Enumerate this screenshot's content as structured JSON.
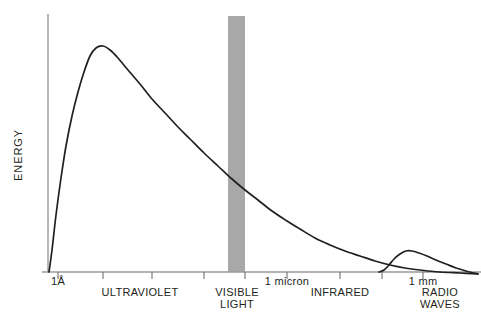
{
  "chart_data": {
    "type": "line",
    "title": "",
    "subtitle": "",
    "xlabel": "",
    "ylabel": "ENERGY",
    "grid": false,
    "legend": "none",
    "axis_style": "schematic, unnumbered logarithmic wavelength axis",
    "xlim": [
      0,
      1
    ],
    "ylim": [
      0,
      1
    ],
    "x_tick_labels": [
      {
        "id": "angstrom",
        "text": "1Å",
        "x_px": 58
      },
      {
        "id": "one-micron",
        "text": "1 micron",
        "x_px": 287
      },
      {
        "id": "one-mm",
        "text": "1 mm",
        "x_px": 423
      }
    ],
    "region_labels": [
      {
        "id": "ultraviolet",
        "text": "ULTRAVIOLET",
        "x_px": 140,
        "row": 2
      },
      {
        "id": "visible",
        "text": "VISIBLE",
        "x_px": 237,
        "row": 2
      },
      {
        "id": "light",
        "text": "LIGHT",
        "x_px": 237,
        "row": 3
      },
      {
        "id": "infrared",
        "text": "INFRARED",
        "x_px": 340,
        "row": 2
      },
      {
        "id": "radio",
        "text": "RADIO",
        "x_px": 440,
        "row": 2
      },
      {
        "id": "waves",
        "text": "WAVES",
        "x_px": 440,
        "row": 3
      }
    ],
    "ticks_px": [
      58,
      103,
      152,
      204,
      245,
      287,
      340,
      382,
      423
    ],
    "visible_band": {
      "label": "VISIBLE LIGHT",
      "color": "#a8a8a8",
      "x_start_px": 228,
      "x_end_px": 245
    },
    "series": [
      {
        "name": "blackbody-spectrum",
        "description": "main energy curve peaking in the ultraviolet and falling through visible, infrared toward radio",
        "points_px": [
          [
            49,
            272
          ],
          [
            52,
            250
          ],
          [
            56,
            215
          ],
          [
            61,
            178
          ],
          [
            66,
            146
          ],
          [
            72,
            116
          ],
          [
            78,
            92
          ],
          [
            84,
            72
          ],
          [
            90,
            56
          ],
          [
            96,
            48
          ],
          [
            103,
            46
          ],
          [
            110,
            50
          ],
          [
            118,
            58
          ],
          [
            128,
            70
          ],
          [
            140,
            84
          ],
          [
            152,
            99
          ],
          [
            165,
            113
          ],
          [
            178,
            127
          ],
          [
            190,
            139
          ],
          [
            204,
            153
          ],
          [
            218,
            166
          ],
          [
            232,
            179
          ],
          [
            245,
            190
          ],
          [
            258,
            200
          ],
          [
            272,
            211
          ],
          [
            287,
            221
          ],
          [
            300,
            229
          ],
          [
            315,
            238
          ],
          [
            330,
            245
          ],
          [
            345,
            251
          ],
          [
            360,
            256
          ],
          [
            375,
            261
          ],
          [
            390,
            265
          ],
          [
            405,
            268
          ],
          [
            420,
            270
          ],
          [
            440,
            272
          ],
          [
            460,
            273
          ],
          [
            478,
            274
          ]
        ]
      },
      {
        "name": "radio-bump",
        "description": "small secondary hump rising near 1 mm and merging with the main curve at the right edge",
        "points_px": [
          [
            379,
            272
          ],
          [
            384,
            270
          ],
          [
            389,
            265
          ],
          [
            394,
            259
          ],
          [
            400,
            254
          ],
          [
            406,
            251
          ],
          [
            412,
            251
          ],
          [
            419,
            253
          ],
          [
            427,
            256
          ],
          [
            436,
            260
          ],
          [
            446,
            264
          ],
          [
            456,
            268
          ],
          [
            466,
            271
          ],
          [
            478,
            274
          ]
        ]
      }
    ]
  },
  "axes": {
    "y_axis": {
      "x_px": 48,
      "y_top_px": 14,
      "y_bottom_px": 272
    },
    "x_axis": {
      "y_px": 272,
      "x_left_px": 42,
      "x_right_px": 481
    },
    "tick_length_px": 7
  },
  "layout": {
    "label_row_y": [
      285,
      296,
      308
    ],
    "background_color": "#ffffff",
    "line_color": "#231f20",
    "axis_color": "#9a9a9a"
  }
}
